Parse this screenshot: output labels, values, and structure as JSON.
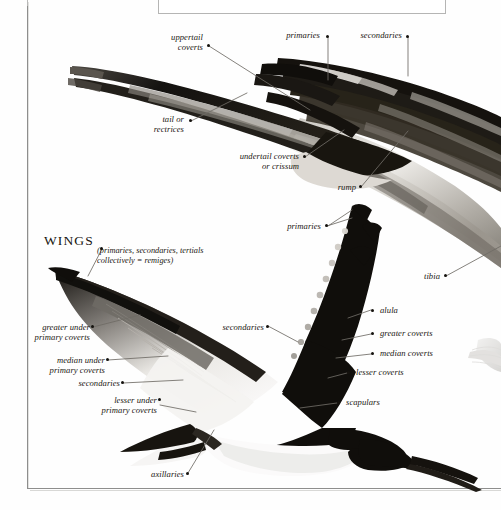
{
  "page": {
    "frame": true,
    "background_color": "#ffffff",
    "ink_color": "#17140f",
    "leader_color": "#6f6c66"
  },
  "caption_box": {
    "visible": true,
    "cropped": true,
    "ghost_text": ""
  },
  "section_heading": {
    "title": "WINGS",
    "subtitle_line_1": "(primaries, secondaries, tertials",
    "subtitle_line_2": "collectively = remiges)"
  },
  "figures": [
    {
      "name": "upper-bird-tail-and-back",
      "description": "rear half of a black skimmer, long forked tail, upper wing"
    },
    {
      "name": "lower-bird-in-flight",
      "description": "black skimmer in flight, wings raised, underwing shown"
    },
    {
      "name": "right-edge-partial-figure",
      "description": "faint partial bird detail cropped at right page edge"
    }
  ],
  "labels": [
    {
      "id": "uppertail-coverts",
      "lines": [
        "uppertail",
        "coverts"
      ],
      "align": "right"
    },
    {
      "id": "primaries-top",
      "lines": [
        "primaries"
      ],
      "align": "right"
    },
    {
      "id": "secondaries-top",
      "lines": [
        "secondaries"
      ],
      "align": "right"
    },
    {
      "id": "tail-or-rectrices",
      "lines": [
        "tail or",
        "rectrices"
      ],
      "align": "right"
    },
    {
      "id": "undertail-coverts",
      "lines": [
        "undertail coverts",
        "or crissum"
      ],
      "align": "right"
    },
    {
      "id": "rump",
      "lines": [
        "rump"
      ],
      "align": "right"
    },
    {
      "id": "primaries-mid",
      "lines": [
        "primaries"
      ],
      "align": "right"
    },
    {
      "id": "tibia",
      "lines": [
        "tibia"
      ],
      "align": "right"
    },
    {
      "id": "wings-remiges",
      "lines": [
        "(primaries, secondaries, tertials",
        "collectively = remiges)"
      ],
      "align": "left"
    },
    {
      "id": "greater-under-primary-coverts",
      "lines": [
        "greater under",
        "primary coverts"
      ],
      "align": "right"
    },
    {
      "id": "median-under-primary-coverts",
      "lines": [
        "median under",
        "primary coverts"
      ],
      "align": "right"
    },
    {
      "id": "secondaries-underwing",
      "lines": [
        "secondaries"
      ],
      "align": "right"
    },
    {
      "id": "lesser-under-primary-coverts",
      "lines": [
        "lesser under",
        "primary coverts"
      ],
      "align": "right"
    },
    {
      "id": "axillaries",
      "lines": [
        "axillaries"
      ],
      "align": "right"
    },
    {
      "id": "secondaries-upperwing",
      "lines": [
        "secondaries"
      ],
      "align": "right"
    },
    {
      "id": "primaries-upperwing",
      "lines": [
        "primaries"
      ],
      "align": "right"
    },
    {
      "id": "alula",
      "lines": [
        "alula"
      ],
      "align": "left"
    },
    {
      "id": "greater-coverts",
      "lines": [
        "greater coverts"
      ],
      "align": "left"
    },
    {
      "id": "median-coverts",
      "lines": [
        "median coverts"
      ],
      "align": "left"
    },
    {
      "id": "lesser-coverts",
      "lines": [
        "lesser coverts"
      ],
      "align": "left"
    },
    {
      "id": "scapulars",
      "lines": [
        "scapulars"
      ],
      "align": "left"
    }
  ]
}
